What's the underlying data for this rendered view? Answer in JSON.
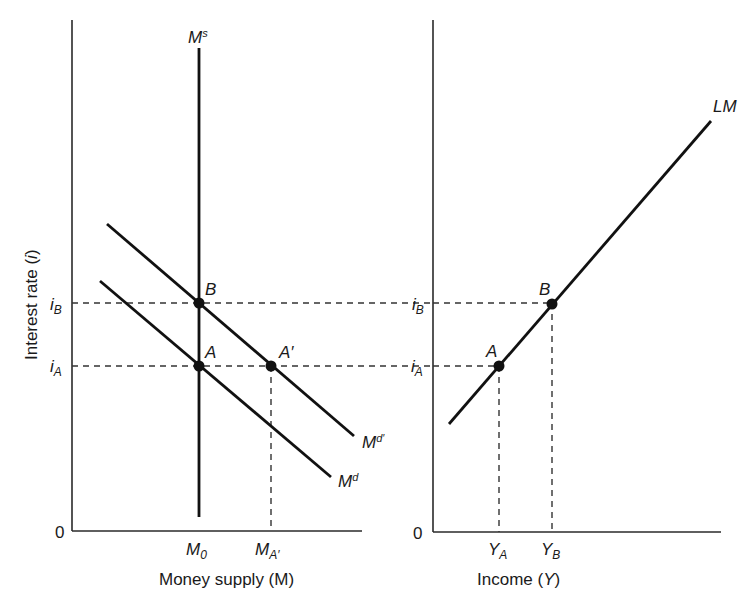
{
  "left_panel": {
    "y_axis_label": "Interest rate (",
    "y_axis_label_var": "i",
    "y_axis_label_close": ")",
    "origin": "0",
    "x_axis_label": "Money supply (M)",
    "ticks_x": [
      {
        "main": "M",
        "sub": "0"
      },
      {
        "main": "M",
        "sub": "A′"
      }
    ],
    "ticks_y": [
      {
        "main": "i",
        "sub": "B"
      },
      {
        "main": "i",
        "sub": "A"
      }
    ],
    "curves": {
      "money_supply": {
        "main": "M",
        "sup": "s"
      },
      "money_demand_shifted": {
        "main": "M",
        "sup": "d′"
      },
      "money_demand": {
        "main": "M",
        "sup": "d"
      }
    },
    "points": [
      "B",
      "A",
      "A′"
    ]
  },
  "right_panel": {
    "origin": "0",
    "x_axis_label": "Income (",
    "x_axis_label_var": "Y",
    "x_axis_label_close": ")",
    "ticks_x": [
      {
        "main": "Y",
        "sub": "A"
      },
      {
        "main": "Y",
        "sub": "B"
      }
    ],
    "ticks_y": [
      {
        "main": "i",
        "sub": "B"
      },
      {
        "main": "i",
        "sub": "A"
      }
    ],
    "curves": {
      "lm": "LM"
    },
    "points": [
      "B",
      "A"
    ]
  }
}
